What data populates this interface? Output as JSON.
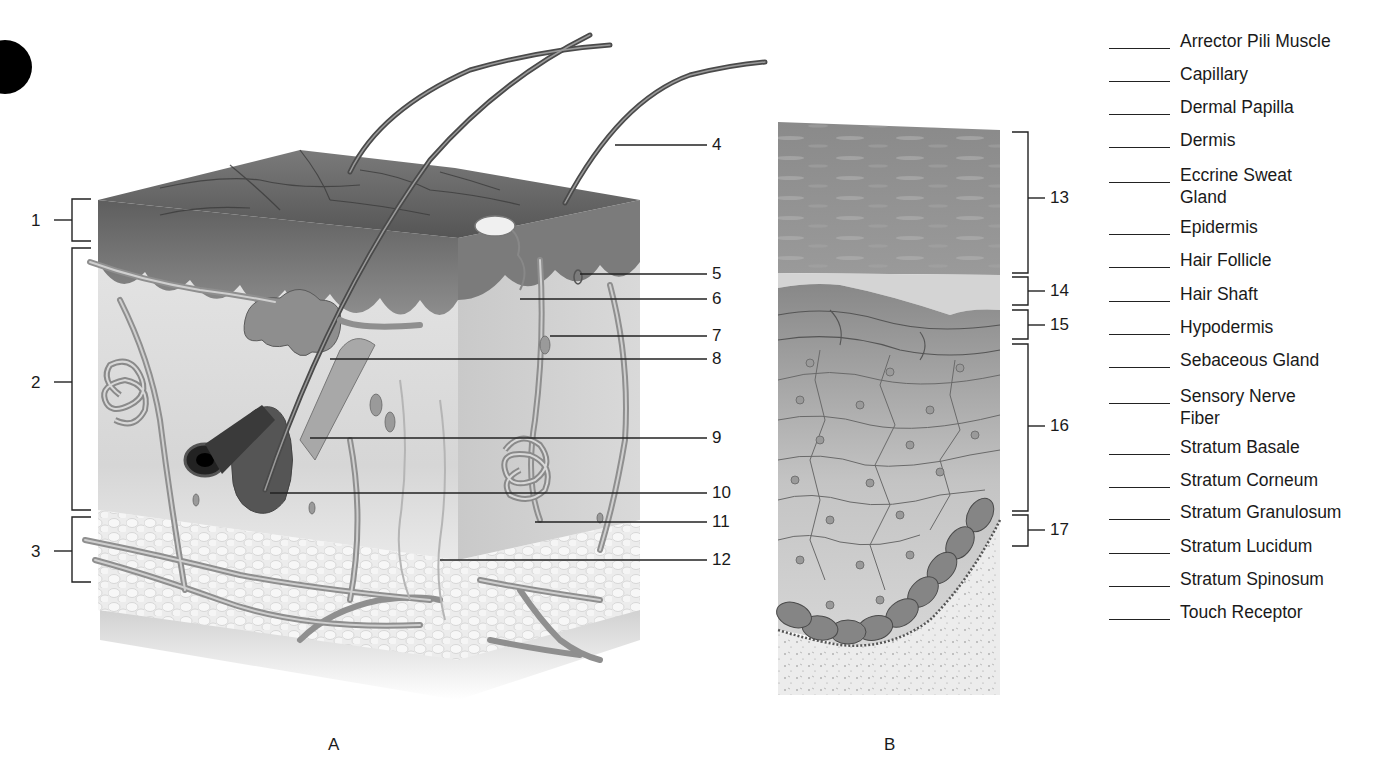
{
  "page": {
    "bullet_marker": "filled-circle"
  },
  "figure_a": {
    "caption": "A",
    "title": "skin-block-cross-section",
    "left_brackets": [
      {
        "number": "1"
      },
      {
        "number": "2"
      },
      {
        "number": "3"
      }
    ],
    "right_callouts": [
      {
        "number": "4"
      },
      {
        "number": "5"
      },
      {
        "number": "6"
      },
      {
        "number": "7"
      },
      {
        "number": "8"
      },
      {
        "number": "9"
      },
      {
        "number": "10"
      },
      {
        "number": "11"
      },
      {
        "number": "12"
      }
    ]
  },
  "figure_b": {
    "caption": "B",
    "title": "epidermis-layers-detail",
    "right_brackets": [
      {
        "number": "13"
      },
      {
        "number": "14"
      },
      {
        "number": "15"
      },
      {
        "number": "16"
      },
      {
        "number": "17"
      }
    ]
  },
  "answer_key": {
    "items": [
      {
        "label": "Arrector Pili Muscle",
        "answer": ""
      },
      {
        "label": "Capillary",
        "answer": ""
      },
      {
        "label": "Dermal Papilla",
        "answer": ""
      },
      {
        "label": "Dermis",
        "answer": ""
      },
      {
        "label": "Eccrine Sweat Gland",
        "answer": ""
      },
      {
        "label": "Epidermis",
        "answer": ""
      },
      {
        "label": "Hair Follicle",
        "answer": ""
      },
      {
        "label": "Hair Shaft",
        "answer": ""
      },
      {
        "label": "Hypodermis",
        "answer": ""
      },
      {
        "label": "Sebaceous Gland",
        "answer": ""
      },
      {
        "label": "Sensory Nerve Fiber",
        "answer": ""
      },
      {
        "label": "Stratum Basale",
        "answer": ""
      },
      {
        "label": "Stratum Corneum",
        "answer": ""
      },
      {
        "label": "Stratum Granulosum",
        "answer": ""
      },
      {
        "label": "Stratum Lucidum",
        "answer": ""
      },
      {
        "label": "Stratum Spinosum",
        "answer": ""
      },
      {
        "label": "Touch Receptor",
        "answer": ""
      }
    ]
  },
  "colors": {
    "ink": "#1a1a1a",
    "epidermis_top": "#6b6b6b",
    "dermis": "#dcdcdc",
    "hypodermis": "#e8e8e8",
    "vessel": "#9a9a9a",
    "corneum": "#8a8a8a",
    "basal_cells": "#7a7a7a"
  }
}
